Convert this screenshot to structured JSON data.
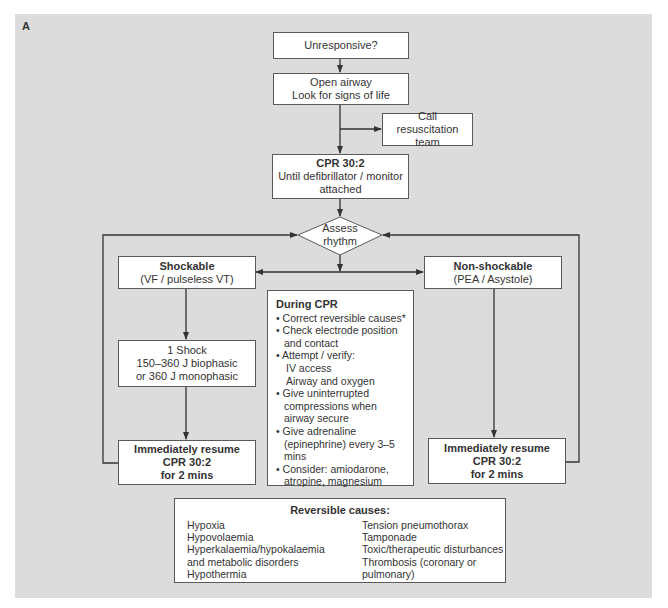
{
  "figure_label": "A",
  "colors": {
    "panel_background": "#dcdcdc",
    "box_fill": "#ffffff",
    "line": "#333333"
  },
  "nodes": {
    "unresponsive": {
      "text": "Unresponsive?"
    },
    "open_airway": {
      "line1": "Open airway",
      "line2": "Look for signs of life"
    },
    "call_team": {
      "line1": "Call",
      "line2": "resuscitation team"
    },
    "cpr_initial": {
      "title": "CPR 30:2",
      "line1": "Until defibrillator / monitor",
      "line2": "attached"
    },
    "assess_rhythm": {
      "line1": "Assess",
      "line2": "rhythm"
    },
    "shockable": {
      "title": "Shockable",
      "subtitle": "(VF / pulseless VT)"
    },
    "non_shockable": {
      "title": "Non-shockable",
      "subtitle": "(PEA / Asystole)"
    },
    "shock": {
      "line1": "1 Shock",
      "line2": "150–360 J biophasic",
      "line3": "or 360 J monophasic"
    },
    "resume_left": {
      "line1": "Immediately resume",
      "line2": "CPR 30:2",
      "line3": "for 2 mins"
    },
    "resume_right": {
      "line1": "Immediately resume",
      "line2": "CPR 30:2",
      "line3": "for 2 mins"
    }
  },
  "during_cpr": {
    "title": "During CPR",
    "items": [
      "• Correct reversible causes*",
      "• Check electrode position and contact",
      "• Attempt / verify:",
      "IV access",
      "Airway and oxygen",
      "• Give uninterrupted compressions when airway secure",
      "• Give adrenaline (epinephrine) every 3–5 mins",
      "• Consider: amiodarone, atropine, magnesium"
    ]
  },
  "reversible_causes": {
    "title": "Reversible causes:",
    "left": [
      "Hypoxia",
      "Hypovolaemia",
      "Hyperkalaemia/hypokalaemia",
      "and metabolic disorders",
      "Hypothermia"
    ],
    "right": [
      "Tension pneumothorax",
      "Tamponade",
      "Toxic/therapeutic disturbances",
      "Thrombosis (coronary or",
      "pulmonary)"
    ]
  }
}
